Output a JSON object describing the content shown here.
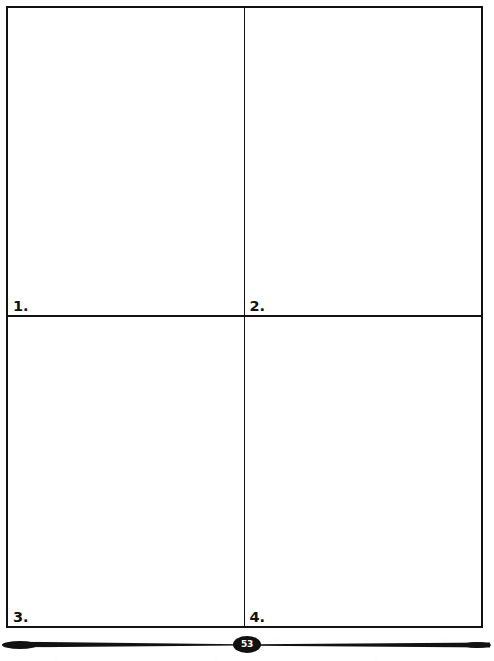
{
  "page": {
    "background_color": "#ffffff",
    "ink_color": "#121212",
    "width": 494,
    "height": 661
  },
  "answer_grid": {
    "name": "four-box-answer-grid",
    "columns": 2,
    "rows": 2,
    "border_color": "#121212",
    "cells": [
      {
        "number_label": "1.",
        "content": ""
      },
      {
        "number_label": "2.",
        "content": ""
      },
      {
        "number_label": "3.",
        "content": ""
      },
      {
        "number_label": "4.",
        "content": ""
      }
    ]
  },
  "footer": {
    "page_number": "53",
    "badge_fill_color": "#101010",
    "badge_text_color": "#ffffff",
    "rule_color": "#121212"
  }
}
